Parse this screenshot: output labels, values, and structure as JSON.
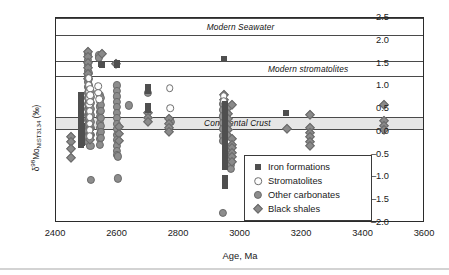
{
  "chart_data": {
    "type": "scatter",
    "title": "",
    "xlabel": "Age, Ma",
    "ylabel": "δ98Mo NIST3134 (‰)",
    "ylabel_parts": {
      "delta": "δ",
      "mass": "98",
      "element": "Mo",
      "standard": "NIST3134",
      "units": "(‰)"
    },
    "xlim": [
      2400,
      3600
    ],
    "ylim": [
      -2.0,
      2.5
    ],
    "xticks": [
      2400,
      2600,
      2800,
      3000,
      3200,
      3400,
      3600
    ],
    "xticklabels": [
      "2400",
      "2600",
      "2800",
      "3000",
      "3200",
      "3400",
      "3600"
    ],
    "xtick_minor_step": 100,
    "yticks": [
      -2.0,
      -1.5,
      -1.0,
      -0.5,
      0.0,
      0.5,
      1.0,
      1.5,
      2.0,
      2.5
    ],
    "yticklabels": [
      "–2.0",
      "–1.5",
      "–1.0",
      "–0.5",
      "0.0",
      "0.5",
      "1.0",
      "1.5",
      "2.0",
      "2.5"
    ],
    "ytick_minor_step": 0.25,
    "grid": false,
    "legend_position": "lower-right",
    "reference_bands": [
      {
        "name": "Modern Seawater",
        "label": "Modern Seawater",
        "y_low": 2.1,
        "y_high": 2.5,
        "style": "lines",
        "fill": "none",
        "label_x": 3000,
        "label_y": 2.31
      },
      {
        "name": "Modern stromatolites",
        "label": "Modern stromatolites",
        "y_low": 1.2,
        "y_high": 1.55,
        "style": "lines",
        "fill": "none",
        "label_x": 3220,
        "label_y": 1.38
      },
      {
        "name": "Continental Crust",
        "label": "Continental Crust",
        "y_low": 0.05,
        "y_high": 0.32,
        "style": "filled",
        "fill": "#e6e6e6",
        "label_x": 2990,
        "label_y": 0.19
      }
    ],
    "series": [
      {
        "name": "Iron formations",
        "marker": "filled-square",
        "color": "#4f4f4f",
        "points": [
          [
            2480,
            0.82
          ],
          [
            2480,
            0.72
          ],
          [
            2480,
            0.62
          ],
          [
            2480,
            0.52
          ],
          [
            2480,
            0.42
          ],
          [
            2480,
            0.3
          ],
          [
            2480,
            0.2
          ],
          [
            2480,
            0.1
          ],
          [
            2480,
            0.0
          ],
          [
            2480,
            -0.1
          ],
          [
            2480,
            -0.2
          ],
          [
            2480,
            -0.28
          ],
          [
            2481,
            0.78
          ],
          [
            2481,
            0.66
          ],
          [
            2481,
            0.55
          ],
          [
            2482,
            0.45
          ],
          [
            2482,
            0.34
          ],
          [
            2482,
            0.24
          ],
          [
            2483,
            0.14
          ],
          [
            2483,
            0.04
          ],
          [
            2483,
            -0.06
          ],
          [
            2484,
            -0.16
          ],
          [
            2484,
            -0.25
          ],
          [
            2545,
            1.5
          ],
          [
            2548,
            1.47
          ],
          [
            2598,
            1.52
          ],
          [
            2598,
            1.46
          ],
          [
            2700,
            0.98
          ],
          [
            2700,
            0.9
          ],
          [
            2700,
            0.56
          ],
          [
            2700,
            0.48
          ],
          [
            2945,
            1.61
          ],
          [
            2948,
            0.62
          ],
          [
            2948,
            0.52
          ],
          [
            2948,
            0.42
          ],
          [
            2948,
            0.32
          ],
          [
            2948,
            0.2
          ],
          [
            2948,
            0.08
          ],
          [
            2948,
            -0.02
          ],
          [
            2948,
            -0.14
          ],
          [
            2948,
            -0.26
          ],
          [
            2948,
            -0.38
          ],
          [
            2948,
            -0.48
          ],
          [
            2948,
            -0.58
          ],
          [
            2948,
            -0.68
          ],
          [
            2948,
            -0.78
          ],
          [
            2948,
            -1.02
          ],
          [
            2948,
            -1.1
          ],
          [
            2948,
            -1.18
          ],
          [
            3148,
            0.42
          ]
        ]
      },
      {
        "name": "Stromatolites",
        "marker": "open-circle",
        "color": "#fdfdfd",
        "points": [
          [
            2506,
            1.18
          ],
          [
            2506,
            1.02
          ],
          [
            2508,
            0.88
          ],
          [
            2508,
            0.74
          ],
          [
            2508,
            0.6
          ],
          [
            2509,
            0.46
          ],
          [
            2509,
            0.32
          ],
          [
            2510,
            0.18
          ],
          [
            2510,
            0.04
          ],
          [
            2510,
            -0.1
          ],
          [
            2512,
            0.95
          ],
          [
            2512,
            0.8
          ],
          [
            2512,
            0.66
          ],
          [
            2538,
            1.0
          ],
          [
            2538,
            0.86
          ],
          [
            2540,
            0.72
          ],
          [
            2770,
            0.96
          ],
          [
            2772,
            0.52
          ],
          [
            2946,
            0.78
          ],
          [
            2946,
            0.68
          ]
        ]
      },
      {
        "name": "Other carbonates",
        "marker": "filled-circle",
        "color": "#8d8d8d",
        "points": [
          [
            2505,
            1.7
          ],
          [
            2505,
            1.58
          ],
          [
            2505,
            1.46
          ],
          [
            2505,
            1.34
          ],
          [
            2505,
            1.22
          ],
          [
            2505,
            1.1
          ],
          [
            2505,
            0.98
          ],
          [
            2505,
            0.86
          ],
          [
            2505,
            0.74
          ],
          [
            2505,
            0.62
          ],
          [
            2505,
            0.5
          ],
          [
            2505,
            0.38
          ],
          [
            2505,
            0.26
          ],
          [
            2505,
            0.14
          ],
          [
            2505,
            0.02
          ],
          [
            2505,
            -0.1
          ],
          [
            2505,
            -0.22
          ],
          [
            2508,
            1.3
          ],
          [
            2508,
            1.16
          ],
          [
            2508,
            1.02
          ],
          [
            2508,
            0.9
          ],
          [
            2508,
            0.78
          ],
          [
            2508,
            0.66
          ],
          [
            2508,
            0.54
          ],
          [
            2508,
            0.4
          ],
          [
            2508,
            0.28
          ],
          [
            2508,
            0.16
          ],
          [
            2512,
            0.88
          ],
          [
            2512,
            0.76
          ],
          [
            2512,
            0.64
          ],
          [
            2512,
            0.5
          ],
          [
            2512,
            0.36
          ],
          [
            2512,
            0.22
          ],
          [
            2512,
            0.08
          ],
          [
            2512,
            -0.06
          ],
          [
            2512,
            -0.3
          ],
          [
            2514,
            -1.06
          ],
          [
            2540,
            1.68
          ],
          [
            2540,
            1.62
          ],
          [
            2544,
            0.8
          ],
          [
            2544,
            0.68
          ],
          [
            2544,
            0.56
          ],
          [
            2544,
            0.44
          ],
          [
            2544,
            0.32
          ],
          [
            2544,
            0.2
          ],
          [
            2544,
            0.08
          ],
          [
            2544,
            -0.04
          ],
          [
            2544,
            -0.16
          ],
          [
            2544,
            -0.28
          ],
          [
            2546,
            0.74
          ],
          [
            2546,
            0.6
          ],
          [
            2546,
            0.46
          ],
          [
            2546,
            0.3
          ],
          [
            2546,
            0.14
          ],
          [
            2546,
            0.0
          ],
          [
            2546,
            -0.14
          ],
          [
            2598,
            1.02
          ],
          [
            2598,
            0.9
          ],
          [
            2598,
            0.78
          ],
          [
            2598,
            0.66
          ],
          [
            2598,
            0.54
          ],
          [
            2598,
            0.42
          ],
          [
            2598,
            0.3
          ],
          [
            2598,
            0.18
          ],
          [
            2598,
            0.06
          ],
          [
            2598,
            -0.06
          ],
          [
            2598,
            -0.18
          ],
          [
            2598,
            -0.3
          ],
          [
            2598,
            -0.42
          ],
          [
            2598,
            -0.5
          ],
          [
            2600,
            -0.54
          ],
          [
            2600,
            -1.02
          ],
          [
            2636,
            0.58
          ],
          [
            2700,
            0.86
          ],
          [
            2770,
            0.26
          ],
          [
            2772,
            0.22
          ],
          [
            2944,
            0.62
          ],
          [
            2944,
            0.48
          ],
          [
            2944,
            0.34
          ],
          [
            2944,
            0.2
          ],
          [
            2944,
            0.06
          ],
          [
            2944,
            -0.08
          ],
          [
            2944,
            -0.2
          ],
          [
            2968,
            -0.42
          ],
          [
            2968,
            -0.52
          ],
          [
            2968,
            -0.62
          ],
          [
            2968,
            -0.72
          ],
          [
            2968,
            -0.82
          ],
          [
            2944,
            -1.78
          ]
        ]
      },
      {
        "name": "Black shales",
        "marker": "filled-diamond",
        "color": "#8a8a8a",
        "points": [
          [
            2448,
            -0.12
          ],
          [
            2448,
            -0.22
          ],
          [
            2448,
            -0.38
          ],
          [
            2448,
            -0.58
          ],
          [
            2504,
            1.75
          ],
          [
            2504,
            1.64
          ],
          [
            2504,
            1.52
          ],
          [
            2504,
            1.4
          ],
          [
            2504,
            1.28
          ],
          [
            2504,
            1.16
          ],
          [
            2510,
            0.06
          ],
          [
            2510,
            -0.06
          ],
          [
            2510,
            -0.18
          ],
          [
            2548,
            1.7
          ],
          [
            2596,
            1.48
          ],
          [
            2604,
            0.1
          ],
          [
            2604,
            -0.04
          ],
          [
            2604,
            -0.2
          ],
          [
            2700,
            0.42
          ],
          [
            2700,
            0.3
          ],
          [
            2700,
            0.22
          ],
          [
            2768,
            0.28
          ],
          [
            2768,
            0.18
          ],
          [
            2768,
            0.08
          ],
          [
            2768,
            0.0
          ],
          [
            2946,
            0.8
          ],
          [
            2946,
            0.7
          ],
          [
            2958,
            0.52
          ],
          [
            2958,
            0.4
          ],
          [
            2958,
            0.28
          ],
          [
            2958,
            0.16
          ],
          [
            2958,
            0.04
          ],
          [
            2958,
            -0.08
          ],
          [
            2972,
            0.6
          ],
          [
            2972,
            -0.16
          ],
          [
            2972,
            -0.28
          ],
          [
            2972,
            -0.36
          ],
          [
            2972,
            -0.46
          ],
          [
            2972,
            -0.56
          ],
          [
            2972,
            -0.66
          ],
          [
            3150,
            0.06
          ],
          [
            3226,
            0.38
          ],
          [
            3226,
            0.08
          ],
          [
            3226,
            -0.02
          ],
          [
            3226,
            -0.12
          ],
          [
            3226,
            -0.22
          ],
          [
            3226,
            -0.3
          ],
          [
            3466,
            0.6
          ],
          [
            3468,
            0.24
          ],
          [
            3468,
            0.14
          ],
          [
            3468,
            0.04
          ]
        ]
      }
    ]
  },
  "legend": {
    "entries": [
      {
        "label": "Iron formations",
        "marker": "filled-square"
      },
      {
        "label": "Stromatolites",
        "marker": "open-circle"
      },
      {
        "label": "Other carbonates",
        "marker": "filled-circle"
      },
      {
        "label": "Black shales",
        "marker": "filled-diamond"
      }
    ]
  },
  "colors": {
    "axis": "#2b2b2b",
    "band_line": "#4a4a4a",
    "band_fill": "#e6e6e6",
    "iron_formations": "#4f4f4f",
    "stromatolites": "#fdfdfd",
    "other_carbonates": "#8d8d8d",
    "black_shales": "#8a8a8a"
  }
}
